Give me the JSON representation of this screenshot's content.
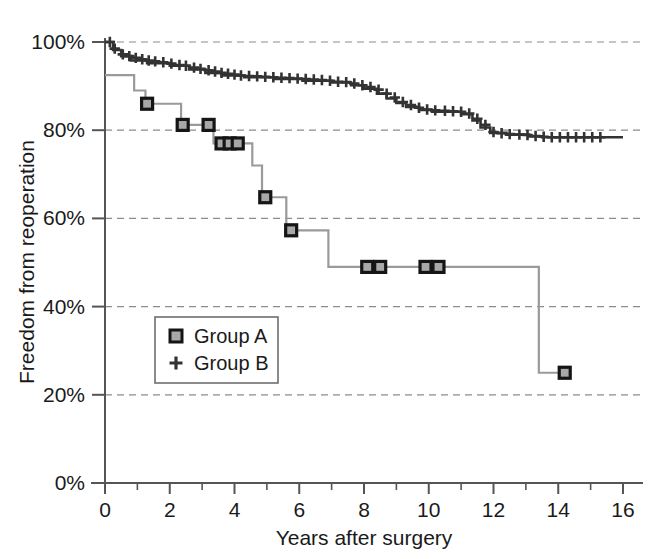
{
  "chart_data": {
    "type": "line",
    "subtype": "kaplan-meier-step",
    "title": "",
    "xlabel": "Years after surgery",
    "ylabel": "Freedom from reoperation",
    "xlim": [
      0,
      16
    ],
    "ylim": [
      0,
      100
    ],
    "xticks": [
      0,
      2,
      4,
      6,
      8,
      10,
      12,
      14,
      16
    ],
    "xtick_labels": [
      "0",
      "2",
      "4",
      "6",
      "8",
      "10",
      "12",
      "14",
      "16"
    ],
    "x_minor_ticks": [
      1,
      3,
      5,
      7,
      9,
      11,
      13,
      15
    ],
    "yticks": [
      0,
      20,
      40,
      60,
      80,
      100
    ],
    "ytick_labels": [
      "0%",
      "20%",
      "40%",
      "60%",
      "80%",
      "100%"
    ],
    "grid": "horizontal-dashed",
    "grid_values": [
      20,
      40,
      60,
      80,
      100
    ],
    "legend_position": "lower-left-inset",
    "series": [
      {
        "name": "Group A",
        "marker": "square",
        "color": "#9a9a9a",
        "marker_color": "#151515",
        "marker_fill": "#a8a8a8",
        "steps": [
          [
            0.0,
            92.5
          ],
          [
            0.9,
            92.5
          ],
          [
            0.9,
            89.0
          ],
          [
            1.25,
            89.0
          ],
          [
            1.25,
            86.0
          ],
          [
            2.35,
            86.0
          ],
          [
            2.35,
            81.2
          ],
          [
            3.35,
            81.2
          ],
          [
            3.35,
            77.0
          ],
          [
            4.55,
            77.0
          ],
          [
            4.55,
            72.0
          ],
          [
            4.85,
            72.0
          ],
          [
            4.85,
            64.8
          ],
          [
            5.6,
            64.8
          ],
          [
            5.6,
            57.3
          ],
          [
            6.9,
            57.3
          ],
          [
            6.9,
            49.0
          ],
          [
            13.4,
            49.0
          ],
          [
            13.4,
            25.0
          ],
          [
            14.35,
            25.0
          ]
        ],
        "censor_points": [
          [
            1.3,
            86.0
          ],
          [
            2.4,
            81.2
          ],
          [
            3.2,
            81.2
          ],
          [
            3.6,
            77.0
          ],
          [
            3.85,
            77.0
          ],
          [
            4.1,
            77.0
          ],
          [
            4.95,
            64.8
          ],
          [
            5.75,
            57.3
          ],
          [
            8.1,
            49.0
          ],
          [
            8.5,
            49.0
          ],
          [
            9.9,
            49.0
          ],
          [
            10.3,
            49.0
          ],
          [
            14.2,
            25.0
          ]
        ]
      },
      {
        "name": "Group B",
        "marker": "plus",
        "color": "#333333",
        "steps": [
          [
            0.0,
            100.0
          ],
          [
            0.25,
            100.0
          ],
          [
            0.25,
            98.2
          ],
          [
            0.5,
            98.2
          ],
          [
            0.5,
            96.8
          ],
          [
            0.8,
            96.8
          ],
          [
            0.8,
            95.8
          ],
          [
            1.3,
            95.8
          ],
          [
            1.3,
            95.2
          ],
          [
            2.0,
            95.2
          ],
          [
            2.0,
            94.6
          ],
          [
            2.6,
            94.6
          ],
          [
            2.6,
            93.8
          ],
          [
            3.1,
            93.8
          ],
          [
            3.1,
            93.0
          ],
          [
            3.6,
            93.0
          ],
          [
            3.6,
            92.4
          ],
          [
            4.3,
            92.4
          ],
          [
            4.3,
            92.0
          ],
          [
            5.2,
            92.0
          ],
          [
            5.2,
            91.6
          ],
          [
            6.1,
            91.6
          ],
          [
            6.1,
            91.2
          ],
          [
            7.0,
            91.2
          ],
          [
            7.0,
            90.8
          ],
          [
            7.6,
            90.8
          ],
          [
            7.6,
            90.2
          ],
          [
            8.0,
            90.2
          ],
          [
            8.0,
            89.4
          ],
          [
            8.4,
            89.4
          ],
          [
            8.4,
            88.3
          ],
          [
            8.7,
            88.3
          ],
          [
            8.7,
            87.2
          ],
          [
            9.0,
            87.2
          ],
          [
            9.0,
            86.2
          ],
          [
            9.3,
            86.2
          ],
          [
            9.3,
            85.3
          ],
          [
            9.7,
            85.3
          ],
          [
            9.7,
            84.6
          ],
          [
            10.1,
            84.6
          ],
          [
            10.1,
            84.2
          ],
          [
            11.0,
            84.2
          ],
          [
            11.0,
            83.6
          ],
          [
            11.35,
            83.6
          ],
          [
            11.35,
            82.2
          ],
          [
            11.6,
            82.2
          ],
          [
            11.6,
            80.6
          ],
          [
            11.9,
            80.6
          ],
          [
            11.9,
            79.4
          ],
          [
            12.4,
            79.4
          ],
          [
            12.4,
            79.0
          ],
          [
            13.1,
            79.0
          ],
          [
            13.1,
            78.6
          ],
          [
            13.5,
            78.6
          ],
          [
            13.5,
            78.4
          ],
          [
            16.0,
            78.4
          ]
        ],
        "censor_points": [
          [
            0.15,
            100.0
          ],
          [
            0.3,
            98.5
          ],
          [
            0.55,
            97.2
          ],
          [
            0.75,
            96.8
          ],
          [
            0.95,
            96.4
          ],
          [
            1.15,
            96.1
          ],
          [
            1.35,
            95.8
          ],
          [
            1.55,
            95.6
          ],
          [
            1.8,
            95.4
          ],
          [
            2.05,
            95.1
          ],
          [
            2.3,
            94.8
          ],
          [
            2.5,
            94.6
          ],
          [
            2.75,
            94.2
          ],
          [
            2.95,
            93.9
          ],
          [
            3.2,
            93.6
          ],
          [
            3.4,
            93.3
          ],
          [
            3.6,
            93.0
          ],
          [
            3.8,
            92.8
          ],
          [
            4.0,
            92.6
          ],
          [
            4.2,
            92.4
          ],
          [
            4.45,
            92.3
          ],
          [
            4.7,
            92.2
          ],
          [
            4.95,
            92.1
          ],
          [
            5.2,
            92.0
          ],
          [
            5.45,
            91.9
          ],
          [
            5.7,
            91.8
          ],
          [
            5.95,
            91.7
          ],
          [
            6.2,
            91.6
          ],
          [
            6.45,
            91.5
          ],
          [
            6.7,
            91.4
          ],
          [
            6.95,
            91.2
          ],
          [
            7.2,
            91.0
          ],
          [
            7.45,
            90.9
          ],
          [
            7.7,
            90.6
          ],
          [
            7.95,
            90.2
          ],
          [
            8.2,
            89.8
          ],
          [
            8.45,
            89.2
          ],
          [
            8.7,
            88.3
          ],
          [
            8.95,
            87.4
          ],
          [
            9.2,
            86.4
          ],
          [
            9.45,
            85.7
          ],
          [
            9.7,
            85.1
          ],
          [
            9.95,
            84.7
          ],
          [
            10.2,
            84.5
          ],
          [
            10.5,
            84.4
          ],
          [
            10.75,
            84.3
          ],
          [
            11.0,
            84.2
          ],
          [
            11.25,
            83.8
          ],
          [
            11.5,
            82.6
          ],
          [
            11.75,
            81.2
          ],
          [
            12.0,
            79.6
          ],
          [
            12.25,
            79.3
          ],
          [
            12.5,
            79.1
          ],
          [
            12.8,
            79.0
          ],
          [
            13.05,
            78.9
          ],
          [
            13.3,
            78.7
          ],
          [
            13.55,
            78.5
          ],
          [
            13.8,
            78.4
          ],
          [
            14.05,
            78.4
          ],
          [
            14.3,
            78.4
          ],
          [
            14.55,
            78.4
          ],
          [
            14.8,
            78.4
          ],
          [
            15.05,
            78.4
          ],
          [
            15.3,
            78.4
          ]
        ]
      }
    ]
  },
  "legend": {
    "entries": [
      {
        "label": "Group A",
        "marker": "square"
      },
      {
        "label": "Group B",
        "marker": "plus"
      }
    ]
  },
  "colors": {
    "group_a_line": "#9a9a9a",
    "group_b_line": "#333333",
    "grid": "#8c8c8c",
    "axis": "#555555",
    "text": "#1a1a1a"
  }
}
